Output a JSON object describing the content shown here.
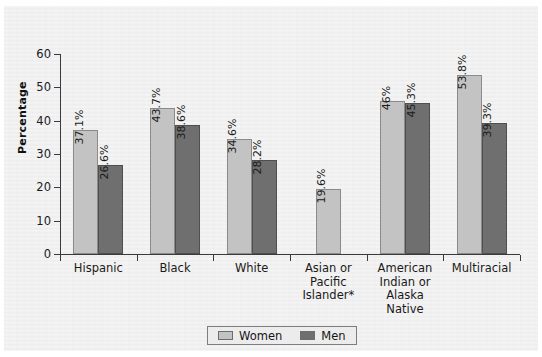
{
  "chart_data": {
    "type": "bar",
    "title": "",
    "xlabel": "",
    "ylabel": "Percentage",
    "ylim": [
      0,
      60
    ],
    "ytick_values": [
      0,
      10,
      20,
      30,
      40,
      50,
      60
    ],
    "ytick_labels": [
      "0",
      "10",
      "20",
      "30",
      "40",
      "50",
      "60"
    ],
    "grid": false,
    "legend_position": "bottom-center",
    "categories": [
      "Hispanic",
      "Black",
      "White",
      "Asian or Pacific Islander*",
      "American Indian or Alaska Native",
      "Multiracial"
    ],
    "category_label_lines": [
      [
        "Hispanic"
      ],
      [
        "Black"
      ],
      [
        "White"
      ],
      [
        "Asian or",
        "Pacific",
        "Islander*"
      ],
      [
        "American",
        "Indian or",
        "Alaska",
        "Native"
      ],
      [
        "Multiracial"
      ]
    ],
    "series": [
      {
        "name": "Women",
        "color": "#c3c3c3",
        "values": [
          37.1,
          43.7,
          34.6,
          19.6,
          46.0,
          53.8
        ],
        "labels": [
          "37.1%",
          "43.7%",
          "34.6%",
          "19.6%",
          "46%",
          "53.8%"
        ]
      },
      {
        "name": "Men",
        "color": "#6f6f6f",
        "values": [
          26.6,
          38.6,
          28.2,
          null,
          45.3,
          39.3
        ],
        "labels": [
          "26.6%",
          "38.6%",
          "28.2%",
          null,
          "45.3%",
          "39.3%"
        ]
      }
    ],
    "legend": [
      "Women",
      "Men"
    ]
  }
}
